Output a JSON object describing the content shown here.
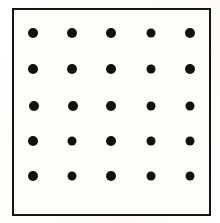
{
  "figure": {
    "kind": "dot-grid-figure",
    "background_color": "#fefefe",
    "frame": {
      "border_color": "#151515",
      "border_width_px": 2,
      "fill_color": "#fdfdfc",
      "left_px": 12,
      "top_px": 8,
      "width_px": 195,
      "height_px": 204
    },
    "grid": {
      "rows": 5,
      "columns": 5,
      "total_dots": 25,
      "dot_color": "#111111",
      "dot_diameter_px": 10,
      "column_centers_px": [
        33,
        72,
        111,
        151,
        190
      ],
      "row_centers_px": [
        33,
        69,
        106,
        141,
        176
      ],
      "column_spacing_px": 39,
      "row_spacing_px": 36
    },
    "dots": [
      {
        "row": 1,
        "col": 1,
        "cx": 33,
        "cy": 33,
        "d": 10
      },
      {
        "row": 1,
        "col": 2,
        "cx": 72,
        "cy": 33,
        "d": 10
      },
      {
        "row": 1,
        "col": 3,
        "cx": 111,
        "cy": 33,
        "d": 10
      },
      {
        "row": 1,
        "col": 4,
        "cx": 151,
        "cy": 33,
        "d": 9
      },
      {
        "row": 1,
        "col": 5,
        "cx": 190,
        "cy": 33,
        "d": 10
      },
      {
        "row": 2,
        "col": 1,
        "cx": 33,
        "cy": 69,
        "d": 10
      },
      {
        "row": 2,
        "col": 2,
        "cx": 72,
        "cy": 69,
        "d": 10
      },
      {
        "row": 2,
        "col": 3,
        "cx": 111,
        "cy": 69,
        "d": 10
      },
      {
        "row": 2,
        "col": 4,
        "cx": 151,
        "cy": 69,
        "d": 9
      },
      {
        "row": 2,
        "col": 5,
        "cx": 190,
        "cy": 69,
        "d": 10
      },
      {
        "row": 3,
        "col": 1,
        "cx": 34,
        "cy": 106,
        "d": 10
      },
      {
        "row": 3,
        "col": 2,
        "cx": 73,
        "cy": 106,
        "d": 10
      },
      {
        "row": 3,
        "col": 3,
        "cx": 111,
        "cy": 106,
        "d": 10
      },
      {
        "row": 3,
        "col": 4,
        "cx": 151,
        "cy": 106,
        "d": 9
      },
      {
        "row": 3,
        "col": 5,
        "cx": 190,
        "cy": 106,
        "d": 9
      },
      {
        "row": 4,
        "col": 1,
        "cx": 33,
        "cy": 141,
        "d": 10
      },
      {
        "row": 4,
        "col": 2,
        "cx": 72,
        "cy": 141,
        "d": 9
      },
      {
        "row": 4,
        "col": 3,
        "cx": 111,
        "cy": 141,
        "d": 10
      },
      {
        "row": 4,
        "col": 4,
        "cx": 151,
        "cy": 141,
        "d": 9
      },
      {
        "row": 4,
        "col": 5,
        "cx": 190,
        "cy": 141,
        "d": 9
      },
      {
        "row": 5,
        "col": 1,
        "cx": 33,
        "cy": 176,
        "d": 10
      },
      {
        "row": 5,
        "col": 2,
        "cx": 72,
        "cy": 176,
        "d": 9
      },
      {
        "row": 5,
        "col": 3,
        "cx": 111,
        "cy": 176,
        "d": 10
      },
      {
        "row": 5,
        "col": 4,
        "cx": 151,
        "cy": 176,
        "d": 9
      },
      {
        "row": 5,
        "col": 5,
        "cx": 190,
        "cy": 176,
        "d": 9
      }
    ]
  }
}
